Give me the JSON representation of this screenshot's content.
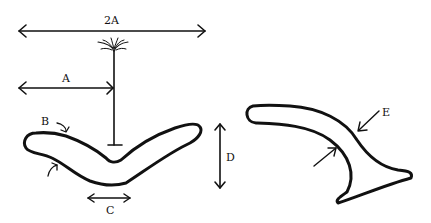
{
  "diagram": {
    "labels": {
      "two_a": "2A",
      "a": "A",
      "b": "B",
      "c": "C",
      "d": "D",
      "e": "E"
    },
    "colors": {
      "ink": "#111111",
      "background": "#ffffff"
    },
    "elements": [
      {
        "id": "dimension-2A",
        "type": "double-arrow",
        "orientation": "horizontal",
        "label": "2A"
      },
      {
        "id": "dimension-A",
        "type": "double-arrow",
        "orientation": "horizontal",
        "label": "A"
      },
      {
        "id": "vertical-stem",
        "type": "line",
        "top": "splayed fibers",
        "bottom": "T-end"
      },
      {
        "id": "boomerang-shape",
        "type": "closed-outline",
        "description": "V-shaped curved body"
      },
      {
        "id": "curved-arrow-B-top",
        "type": "curved-arrow",
        "label": "B"
      },
      {
        "id": "curved-arrow-B-bottom",
        "type": "curved-arrow"
      },
      {
        "id": "dimension-C",
        "type": "double-arrow",
        "orientation": "horizontal",
        "label": "C"
      },
      {
        "id": "dimension-D",
        "type": "double-arrow",
        "orientation": "vertical",
        "label": "D"
      },
      {
        "id": "hook-shape",
        "type": "closed-outline",
        "description": "curved hook with flared tip"
      },
      {
        "id": "arrow-E-outer",
        "type": "arrow",
        "label": "E"
      },
      {
        "id": "arrow-E-inner",
        "type": "arrow"
      }
    ]
  }
}
